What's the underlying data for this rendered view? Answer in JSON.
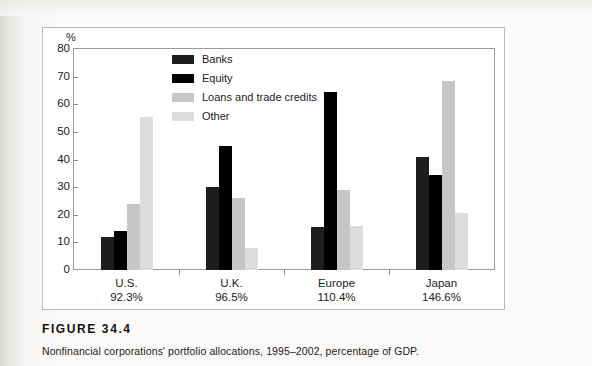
{
  "figure": {
    "number_label": "FIGURE 34.4",
    "caption": "Nonfinancial corporations' portfolio allocations, 1995–2002, percentage of GDP."
  },
  "chart_data": {
    "type": "bar",
    "title": "",
    "subtitle": "",
    "xlabel": "",
    "ylabel": "%",
    "ylim": [
      0,
      80
    ],
    "yticks": [
      0,
      10,
      20,
      30,
      40,
      50,
      60,
      70,
      80
    ],
    "ytick_labels": [
      "0",
      "10",
      "20",
      "30",
      "40",
      "50",
      "60",
      "70",
      "80"
    ],
    "grid": false,
    "legend_position": "inside-top-left",
    "categories": [
      "U.S.",
      "U.K.",
      "Europe",
      "Japan"
    ],
    "category_sublabels": [
      "92.3%",
      "96.5%",
      "110.4%",
      "146.6%"
    ],
    "series": [
      {
        "name": "Banks",
        "color": "#1d1d1d",
        "values": [
          11.8,
          30.0,
          15.5,
          41.0
        ]
      },
      {
        "name": "Equity",
        "color": "#000000",
        "values": [
          14.0,
          45.0,
          64.5,
          34.5
        ]
      },
      {
        "name": "Loans and trade credits",
        "color": "#c6c6c6",
        "values": [
          23.8,
          26.0,
          29.0,
          68.5
        ]
      },
      {
        "name": "Other",
        "color": "#dddddd",
        "values": [
          55.5,
          8.0,
          16.0,
          20.5
        ]
      }
    ]
  },
  "legend": {
    "items": [
      {
        "label": "Banks",
        "color": "#1d1d1d"
      },
      {
        "label": "Equity",
        "color": "#000000"
      },
      {
        "label": "Loans and trade credits",
        "color": "#c6c6c6"
      },
      {
        "label": "Other",
        "color": "#dddddd"
      }
    ]
  },
  "colors": {
    "page_background": "#fbfaf9",
    "figure_background": "#ffffff",
    "frame_border": "#9a9a9a",
    "axis_text": "#1b1b1b"
  }
}
